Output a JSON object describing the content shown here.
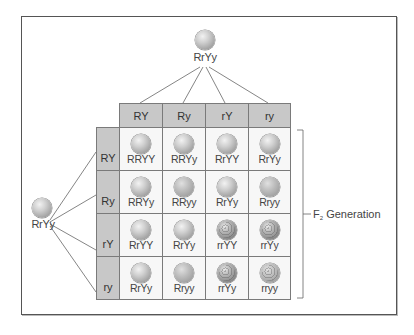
{
  "figure": {
    "type": "Punnett square (dihybrid cross)",
    "parent_top": {
      "genotype": "RrYy"
    },
    "parent_left": {
      "genotype": "RrYy"
    },
    "gametes_top": [
      "RY",
      "Ry",
      "rY",
      "ry"
    ],
    "gametes_left": [
      "RY",
      "Ry",
      "rY",
      "ry"
    ],
    "generation_label": {
      "prefix": "F",
      "subscript": "2",
      "suffix": " Generation"
    },
    "grid": [
      [
        {
          "genotype": "RRYY",
          "phenotype": "round-yellow"
        },
        {
          "genotype": "RRYy",
          "phenotype": "round-yellow"
        },
        {
          "genotype": "RrYY",
          "phenotype": "round-yellow"
        },
        {
          "genotype": "RrYy",
          "phenotype": "round-yellow"
        }
      ],
      [
        {
          "genotype": "RRYy",
          "phenotype": "round-yellow"
        },
        {
          "genotype": "RRyy",
          "phenotype": "round-green"
        },
        {
          "genotype": "RrYy",
          "phenotype": "round-yellow"
        },
        {
          "genotype": "Rryy",
          "phenotype": "round-green"
        }
      ],
      [
        {
          "genotype": "RrYY",
          "phenotype": "round-yellow"
        },
        {
          "genotype": "RrYy",
          "phenotype": "round-yellow"
        },
        {
          "genotype": "rrYY",
          "phenotype": "wrinkled-yellow"
        },
        {
          "genotype": "rrYy",
          "phenotype": "wrinkled-yellow"
        }
      ],
      [
        {
          "genotype": "RrYy",
          "phenotype": "round-yellow"
        },
        {
          "genotype": "Rryy",
          "phenotype": "round-green"
        },
        {
          "genotype": "rrYy",
          "phenotype": "wrinkled-yellow"
        },
        {
          "genotype": "rryy",
          "phenotype": "wrinkled-green"
        }
      ]
    ]
  },
  "colors": {
    "header_fill": "#c8c8c8",
    "cell_fill": "#f7f7f7",
    "border": "#7a7a7a",
    "frame": "#555555"
  }
}
